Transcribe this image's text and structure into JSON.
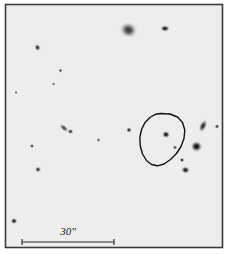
{
  "figure": {
    "type": "astronomical-finding-chart",
    "canvas": {
      "width": 229,
      "height": 254
    },
    "frame": {
      "x": 5.5,
      "y": 4.5,
      "width": 217,
      "height": 243,
      "border_color": "#3a3a3a",
      "border_width": 1.6,
      "background_color": "#f3f3f3"
    },
    "scale_bar": {
      "label": "30\"",
      "label_x": 68,
      "label_y": 235,
      "line_y": 242,
      "x_start": 22,
      "x_end": 114,
      "tick_height": 6,
      "color": "#2b2b2b",
      "stroke_width": 1.2
    },
    "contour": {
      "name": "error-contour",
      "color": "#111111",
      "stroke_width": 1.4,
      "points": [
        [
          160.5,
          113.5
        ],
        [
          170.0,
          114.0
        ],
        [
          177.5,
          117.0
        ],
        [
          182.5,
          122.5
        ],
        [
          184.8,
          130.0
        ],
        [
          184.0,
          138.5
        ],
        [
          181.0,
          146.5
        ],
        [
          176.5,
          153.5
        ],
        [
          170.5,
          159.5
        ],
        [
          164.0,
          164.0
        ],
        [
          157.5,
          165.8
        ],
        [
          151.5,
          164.5
        ],
        [
          146.5,
          160.5
        ],
        [
          142.5,
          154.0
        ],
        [
          140.3,
          146.0
        ],
        [
          139.8,
          137.5
        ],
        [
          141.5,
          129.5
        ],
        [
          145.0,
          122.5
        ],
        [
          150.5,
          117.0
        ],
        [
          155.5,
          114.3
        ]
      ]
    },
    "objects": [
      {
        "id": "star-01",
        "label": "diffuse-object-north",
        "cx": 128.5,
        "cy": 30.0,
        "r": 8.5,
        "peak": 0.42,
        "elongation": 1.15,
        "angle": 20
      },
      {
        "id": "star-02",
        "label": "star-north-east",
        "cx": 165.0,
        "cy": 28.5,
        "r": 3.6,
        "peak": 0.8,
        "elongation": 1.45,
        "angle": 0
      },
      {
        "id": "star-03",
        "label": "star-upper-left",
        "cx": 37.5,
        "cy": 47.5,
        "r": 3.2,
        "peak": 0.6,
        "elongation": 1.25,
        "angle": 70
      },
      {
        "id": "star-04",
        "label": "faint-star-left-a",
        "cx": 60.5,
        "cy": 70.5,
        "r": 2.3,
        "peak": 0.34,
        "elongation": 1.0,
        "angle": 0
      },
      {
        "id": "star-05",
        "label": "faint-star-left-b",
        "cx": 53.5,
        "cy": 84.0,
        "r": 1.9,
        "peak": 0.2,
        "elongation": 1.0,
        "angle": 0
      },
      {
        "id": "star-06",
        "label": "faint-star-left-c",
        "cx": 16.0,
        "cy": 92.5,
        "r": 1.8,
        "peak": 0.16,
        "elongation": 1.0,
        "angle": 0
      },
      {
        "id": "star-07",
        "label": "faint-streak-mid",
        "cx": 64.0,
        "cy": 128.0,
        "r": 3.0,
        "peak": 0.3,
        "elongation": 2.1,
        "angle": 40
      },
      {
        "id": "star-08",
        "label": "star-mid-left",
        "cx": 70.5,
        "cy": 131.5,
        "r": 2.9,
        "peak": 0.52,
        "elongation": 1.1,
        "angle": 0
      },
      {
        "id": "star-09",
        "label": "faint-star-mid-a",
        "cx": 98.5,
        "cy": 140.0,
        "r": 2.2,
        "peak": 0.26,
        "elongation": 1.0,
        "angle": 0
      },
      {
        "id": "star-10",
        "label": "star-mid-centre",
        "cx": 129.0,
        "cy": 130.0,
        "r": 3.1,
        "peak": 0.62,
        "elongation": 1.0,
        "angle": 0
      },
      {
        "id": "star-11",
        "label": "star-far-left-mid",
        "cx": 32.0,
        "cy": 146.0,
        "r": 2.4,
        "peak": 0.38,
        "elongation": 1.0,
        "angle": 0
      },
      {
        "id": "star-12",
        "label": "star-left-lower",
        "cx": 38.0,
        "cy": 169.5,
        "r": 3.2,
        "peak": 0.5,
        "elongation": 1.1,
        "angle": 0
      },
      {
        "id": "star-13",
        "label": "star-in-contour",
        "cx": 166.0,
        "cy": 134.5,
        "r": 4.0,
        "peak": 0.92,
        "elongation": 1.1,
        "angle": 20
      },
      {
        "id": "star-14",
        "label": "faint-star-in-contour",
        "cx": 175.0,
        "cy": 147.5,
        "r": 2.5,
        "peak": 0.33,
        "elongation": 1.0,
        "angle": 0
      },
      {
        "id": "star-15",
        "label": "bright-star-east",
        "cx": 196.5,
        "cy": 146.5,
        "r": 6.2,
        "peak": 1.0,
        "elongation": 1.05,
        "angle": 0
      },
      {
        "id": "star-16",
        "label": "elongated-object-east",
        "cx": 203.0,
        "cy": 126.0,
        "r": 4.0,
        "peak": 0.62,
        "elongation": 1.9,
        "angle": 115
      },
      {
        "id": "star-17",
        "label": "star-east-edge",
        "cx": 217.0,
        "cy": 126.5,
        "r": 2.6,
        "peak": 0.58,
        "elongation": 1.0,
        "angle": 0
      },
      {
        "id": "star-18",
        "label": "star-south-east-a",
        "cx": 182.0,
        "cy": 160.0,
        "r": 2.6,
        "peak": 0.62,
        "elongation": 1.0,
        "angle": 0
      },
      {
        "id": "star-19",
        "label": "star-south-east-b",
        "cx": 185.5,
        "cy": 170.0,
        "r": 4.0,
        "peak": 0.88,
        "elongation": 1.2,
        "angle": 10
      },
      {
        "id": "star-20",
        "label": "star-south-west-corner",
        "cx": 14.0,
        "cy": 221.0,
        "r": 3.4,
        "peak": 0.82,
        "elongation": 1.1,
        "angle": 0
      }
    ]
  }
}
